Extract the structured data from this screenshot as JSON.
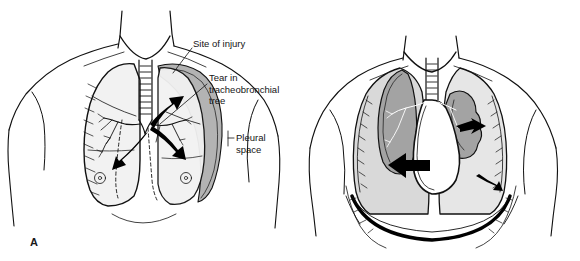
{
  "figure": {
    "background_color": "#ffffff",
    "ink_color": "#000000",
    "pleural_air_gray": "#b3b3b3",
    "collapsed_lung_gray": "#a0a0a0",
    "lung_tint": "#f0f0f0"
  },
  "panels": [
    {
      "id": "A",
      "label": "A",
      "description": "Anterior chest showing tear in tracheobronchial tree with air escaping into the right pleural space"
    },
    {
      "id": "B",
      "label": "B",
      "description": "Anterior chest showing tension pneumothorax with collapsed lungs, mediastinal shift and depressed diaphragm"
    }
  ],
  "callouts": [
    {
      "id": "site-of-injury",
      "text": "Site of injury",
      "panel": "A"
    },
    {
      "id": "tear-in-tracheobronchial-tree",
      "text": "Tear in\ntracheobronchial\ntree",
      "panel": "A"
    },
    {
      "id": "pleural-space",
      "text": "Pleural\nspace",
      "panel": "A"
    }
  ]
}
